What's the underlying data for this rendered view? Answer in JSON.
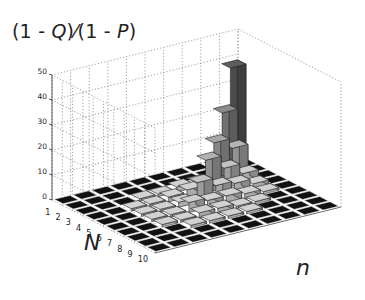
{
  "title_parts": [
    "(1 - ",
    "Q",
    ")⁄(1 - ",
    "P",
    ")"
  ],
  "chart_data": {
    "type": "bar3d",
    "xlabel": "n",
    "ylabel": "N",
    "zlabel": "",
    "zlim": [
      0,
      50
    ],
    "zticks": [
      0,
      10,
      20,
      30,
      40,
      50
    ],
    "N_ticks": [
      1,
      2,
      3,
      4,
      5,
      6,
      7,
      8,
      9,
      10
    ],
    "n_count": 10,
    "grid": true,
    "values": [
      [
        0,
        0,
        0,
        0,
        0,
        0,
        0,
        0,
        0,
        38
      ],
      [
        0,
        0,
        0,
        0,
        0,
        0,
        0,
        0,
        24,
        0
      ],
      [
        0,
        0,
        0,
        1,
        1,
        2,
        2,
        16,
        12,
        0
      ],
      [
        0,
        0,
        1,
        1,
        2,
        3,
        13,
        8,
        4,
        0
      ],
      [
        0,
        0,
        1,
        1,
        2,
        8,
        5,
        4,
        2,
        0
      ],
      [
        0,
        0,
        1,
        1,
        4,
        3,
        3,
        2,
        1,
        0
      ],
      [
        0,
        0,
        1,
        1,
        2,
        2,
        1,
        1,
        0,
        0
      ],
      [
        0,
        0,
        0,
        1,
        1,
        1,
        1,
        0,
        0,
        0
      ],
      [
        0,
        0,
        0,
        0,
        0,
        0,
        0,
        0,
        0,
        0
      ],
      [
        0,
        0,
        0,
        0,
        0,
        0,
        0,
        0,
        0,
        0
      ]
    ]
  },
  "axis_labels": {
    "N": "N",
    "n": "n"
  }
}
